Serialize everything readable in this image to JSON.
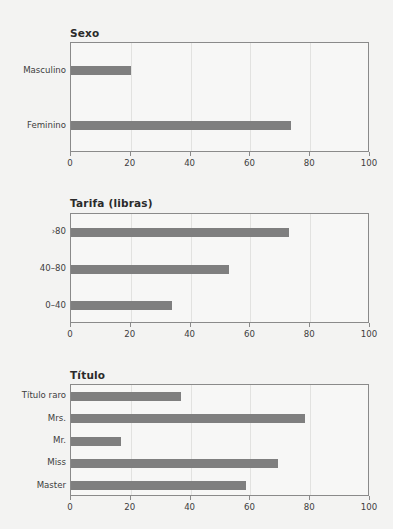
{
  "figure": {
    "background_color": "#f3f3f2",
    "bar_color": "#7f7f7f",
    "axis_color": "#8a8a8a"
  },
  "chart_data": [
    {
      "type": "bar",
      "orientation": "horizontal",
      "title": "Sexo",
      "xlabel": "",
      "ylabel": "",
      "xlim": [
        0,
        100
      ],
      "xticks": [
        0,
        20,
        40,
        60,
        80,
        100
      ],
      "xticklabels": [
        "0",
        "20",
        "40",
        "60",
        "80",
        "100"
      ],
      "grid": true,
      "legend": null,
      "categories": [
        "Feminino",
        "Masculino"
      ],
      "values": [
        73.5,
        20.0
      ]
    },
    {
      "type": "bar",
      "orientation": "horizontal",
      "title": "Tarifa (libras)",
      "xlabel": "",
      "ylabel": "",
      "xlim": [
        0,
        100
      ],
      "xticks": [
        0,
        20,
        40,
        60,
        80,
        100
      ],
      "xticklabels": [
        "0",
        "20",
        "40",
        "60",
        "80",
        "100"
      ],
      "grid": true,
      "legend": null,
      "categories": [
        "0–40",
        "40–80",
        "›80"
      ],
      "values": [
        33.8,
        53.0,
        73.0
      ]
    },
    {
      "type": "bar",
      "orientation": "horizontal",
      "title": "Título",
      "xlabel": "",
      "ylabel": "",
      "xlim": [
        0,
        100
      ],
      "xticks": [
        0,
        20,
        40,
        60,
        80,
        100
      ],
      "xticklabels": [
        "0",
        "20",
        "40",
        "60",
        "80",
        "100"
      ],
      "grid": true,
      "legend": null,
      "categories": [
        "Master",
        "Miss",
        "Mr.",
        "Mrs.",
        "Título raro"
      ],
      "values": [
        58.5,
        69.2,
        16.7,
        78.3,
        36.8
      ]
    }
  ]
}
